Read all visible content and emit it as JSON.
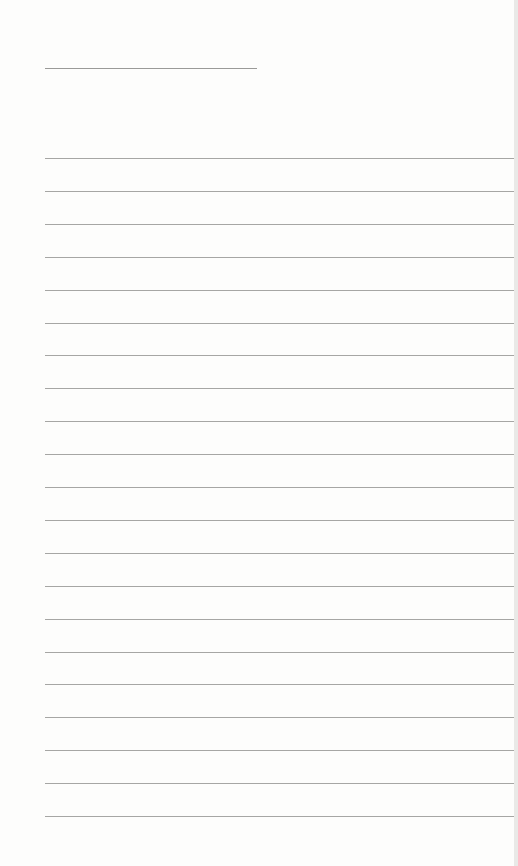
{
  "document": {
    "type": "blank lined sheet",
    "title_line": {
      "text": ""
    },
    "writing_lines": [
      {
        "text": ""
      },
      {
        "text": ""
      },
      {
        "text": ""
      },
      {
        "text": ""
      },
      {
        "text": ""
      },
      {
        "text": ""
      },
      {
        "text": ""
      },
      {
        "text": ""
      },
      {
        "text": ""
      },
      {
        "text": ""
      },
      {
        "text": ""
      },
      {
        "text": ""
      },
      {
        "text": ""
      },
      {
        "text": ""
      },
      {
        "text": ""
      },
      {
        "text": ""
      },
      {
        "text": ""
      },
      {
        "text": ""
      },
      {
        "text": ""
      },
      {
        "text": ""
      },
      {
        "text": ""
      }
    ],
    "colors": {
      "paper": "#fdfdfc",
      "rule": "#a6a6a4"
    }
  }
}
